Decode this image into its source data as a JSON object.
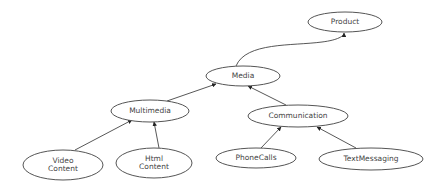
{
  "diagram": {
    "type": "hierarchy",
    "nodes": [
      {
        "id": "product",
        "label": "Product",
        "lines": [
          "Product"
        ],
        "cx": 345,
        "cy": 22,
        "rx": 37,
        "ry": 10
      },
      {
        "id": "media",
        "label": "Media",
        "lines": [
          "Media"
        ],
        "cx": 243,
        "cy": 76,
        "rx": 37,
        "ry": 10
      },
      {
        "id": "multimedia",
        "label": "Multimedia",
        "lines": [
          "Multimedia"
        ],
        "cx": 150,
        "cy": 111,
        "rx": 39,
        "ry": 11
      },
      {
        "id": "communication",
        "label": "Communication",
        "lines": [
          "Communication"
        ],
        "cx": 298,
        "cy": 116,
        "rx": 50,
        "ry": 11
      },
      {
        "id": "video-content",
        "label": "Video Content",
        "lines": [
          "Video",
          "Content"
        ],
        "cx": 63,
        "cy": 165,
        "rx": 40,
        "ry": 15
      },
      {
        "id": "html-content",
        "label": "Html Content",
        "lines": [
          "Html",
          "Content"
        ],
        "cx": 154,
        "cy": 163,
        "rx": 38,
        "ry": 15
      },
      {
        "id": "phonecalls",
        "label": "PhoneCalls",
        "lines": [
          "PhoneCalls"
        ],
        "cx": 256,
        "cy": 158,
        "rx": 40,
        "ry": 10
      },
      {
        "id": "textmessaging",
        "label": "TextMessaging",
        "lines": [
          "TextMessaging"
        ],
        "cx": 371,
        "cy": 159,
        "rx": 52,
        "ry": 11
      }
    ],
    "edges": [
      {
        "from": "media",
        "to": "product",
        "path": "M236,66 C246,42 292,46 322,42 C338,40 344,36 344,33"
      },
      {
        "from": "multimedia",
        "to": "media",
        "path": "M167,101 L216,84"
      },
      {
        "from": "communication",
        "to": "media",
        "path": "M286,105 L248,86"
      },
      {
        "from": "video-content",
        "to": "multimedia",
        "path": "M75,150 L132,120"
      },
      {
        "from": "html-content",
        "to": "multimedia",
        "path": "M159,148 L154,122"
      },
      {
        "from": "phonecalls",
        "to": "communication",
        "path": "M261,148 L281,127"
      },
      {
        "from": "textmessaging",
        "to": "communication",
        "path": "M356,148 L317,127"
      }
    ]
  }
}
